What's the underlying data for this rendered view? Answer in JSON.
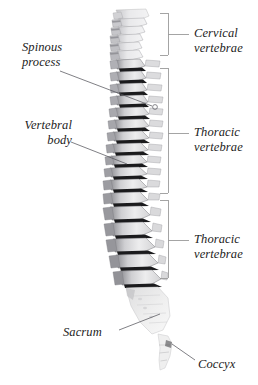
{
  "figure": {
    "background_color": "#ffffff",
    "width": 258,
    "height": 385
  },
  "style": {
    "label_color": "#1c1c1c",
    "bracket_color": "#9a9a9a",
    "leader_color": "#55555c",
    "bone_light": "#e9e9ea",
    "bone_mid": "#bfbfc2",
    "bone_dark": "#5d5d61",
    "bone_shadow": "#1a1a1c"
  },
  "brackets": [
    {
      "name": "cervical",
      "label": "Cervical\nvertebrae",
      "label_x": 194,
      "label_y": 26,
      "top": 13,
      "bottom": 55,
      "spine_x": 168,
      "cap_x": 160,
      "tick_y": 34,
      "tick_x_end": 189
    },
    {
      "name": "thoracic-upper",
      "label": "Thoracic\nvertebrae",
      "label_x": 194,
      "label_y": 125,
      "top": 68,
      "bottom": 193,
      "spine_x": 168,
      "cap_x": 160,
      "tick_y": 133,
      "tick_x_end": 189
    },
    {
      "name": "thoracic-lower",
      "label": "Thoracic\nvertebrae",
      "label_x": 194,
      "label_y": 232,
      "top": 200,
      "bottom": 278,
      "spine_x": 168,
      "cap_x": 160,
      "tick_y": 240,
      "tick_x_end": 189
    }
  ],
  "callouts": [
    {
      "name": "spinous-process",
      "label": "Spinous\nprocess",
      "label_x": 22,
      "label_y": 40,
      "label_align": "left",
      "leader": {
        "x1": 60,
        "y1": 71,
        "x2": 152,
        "y2": 106
      },
      "marker": {
        "cx": 155,
        "cy": 107,
        "r": 2.4
      }
    },
    {
      "name": "vertebral-body",
      "label": "Vertebral\nbody",
      "label_x": 34,
      "label_y": 118,
      "label_align": "left",
      "leader": {
        "x1": 71,
        "y1": 142,
        "x2": 127,
        "y2": 164
      },
      "marker": null
    },
    {
      "name": "sacrum",
      "label": "Sacrum",
      "label_x": 68,
      "label_y": 325,
      "label_align": "left",
      "leader": {
        "x1": 119,
        "y1": 330,
        "x2": 160,
        "y2": 314
      },
      "marker": null
    },
    {
      "name": "coccyx",
      "label": "Coccyx",
      "label_x": 198,
      "label_y": 357,
      "label_align": "left",
      "leader": {
        "x1": 195,
        "y1": 360,
        "x2": 172,
        "y2": 344
      },
      "marker": null
    }
  ],
  "spine_regions": [
    {
      "name": "cervical",
      "vertebra_count": 7,
      "y_start": 12,
      "y_end": 58
    },
    {
      "name": "thoracic",
      "vertebra_count": 12,
      "y_end": 196,
      "y_start": 60
    },
    {
      "name": "lumbar",
      "vertebra_count": 5,
      "y_start": 198,
      "y_end": 288
    },
    {
      "name": "sacrum",
      "vertebra_count": 1,
      "y_start": 290,
      "y_end": 340
    },
    {
      "name": "coccyx",
      "vertebra_count": 1,
      "y_start": 340,
      "y_end": 372
    }
  ]
}
